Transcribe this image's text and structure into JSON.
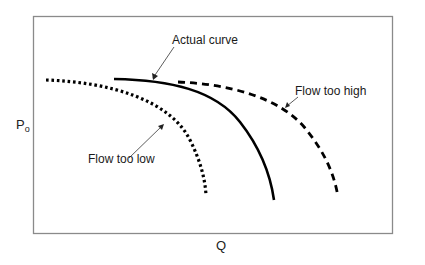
{
  "diagram": {
    "type": "pump-performance-curves",
    "axes": {
      "x_label": "Q",
      "y_label_main": "P",
      "y_label_sub": "o"
    },
    "curves": [
      {
        "name": "actual-curve",
        "label": "Actual curve",
        "style": "solid"
      },
      {
        "name": "flow-too-high-curve",
        "label": "Flow too high",
        "style": "dashed"
      },
      {
        "name": "flow-too-low-curve",
        "label": "Flow too low",
        "style": "dotted"
      }
    ],
    "colors": {
      "frame": "#8a8a8a",
      "curves": "#000000",
      "background": "#ffffff"
    }
  }
}
